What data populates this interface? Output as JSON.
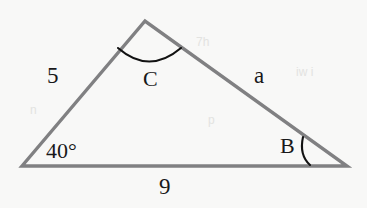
{
  "figure": {
    "type": "triangle-diagram",
    "background_color": "#f8f8f7",
    "stroke_color": "#808082",
    "arc_color": "#111111",
    "text_color": "#18181a",
    "vertices": {
      "left": {
        "name": "A",
        "x": 22,
        "y": 166
      },
      "top": {
        "name": "C",
        "x": 145,
        "y": 21
      },
      "right": {
        "name": "B",
        "x": 347,
        "y": 166
      }
    },
    "labels": {
      "side_left": "5",
      "side_right": "a",
      "side_bottom": "9",
      "angle_left": "40°",
      "angle_right": "B",
      "angle_top": "C"
    },
    "arcs": {
      "angle_c": {
        "start_x": 118,
        "start_y": 48,
        "end_x": 181,
        "end_y": 48,
        "sag_y": 65
      },
      "angle_b": {
        "start_x": 303,
        "start_y": 137,
        "end_x": 311,
        "end_y": 165
      }
    },
    "ghost_marks": [
      "7h",
      "iw i",
      "p",
      "n"
    ]
  }
}
